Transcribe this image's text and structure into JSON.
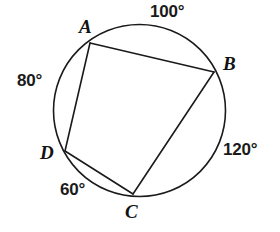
{
  "figure": {
    "type": "circle-inscribed-quadrilateral",
    "background_color": "#ffffff",
    "stroke_color": "#1a1a1a",
    "label_color": "#121212"
  },
  "circle": {
    "name": "circumscribed-circle",
    "center_x": 139.5,
    "center_y": 110.5,
    "radius": 86,
    "stroke_width": 1.6
  },
  "vertices": [
    {
      "id": "A",
      "label": "A",
      "x": 90,
      "y": 43
    },
    {
      "id": "B",
      "label": "B",
      "x": 214,
      "y": 72
    },
    {
      "id": "C",
      "label": "C",
      "x": 133,
      "y": 194
    },
    {
      "id": "D",
      "label": "D",
      "x": 65,
      "y": 151
    }
  ],
  "chords": [
    {
      "id": "AB",
      "from": "A",
      "to": "B",
      "x1": 90,
      "y1": 43,
      "x2": 214,
      "y2": 72
    },
    {
      "id": "BC",
      "from": "B",
      "to": "C",
      "x1": 214,
      "y1": 72,
      "x2": 133,
      "y2": 194
    },
    {
      "id": "CD",
      "from": "C",
      "to": "D",
      "x1": 133,
      "y1": 194,
      "x2": 65,
      "y2": 151
    },
    {
      "id": "DA",
      "from": "D",
      "to": "A",
      "x1": 65,
      "y1": 151,
      "x2": 90,
      "y2": 43
    }
  ],
  "arc_measures": [
    {
      "id": "arc-AB",
      "arc": "AB",
      "value": "100°",
      "position": "top"
    },
    {
      "id": "arc-DA",
      "arc": "DA",
      "value": "80°",
      "position": "left"
    },
    {
      "id": "arc-BC",
      "arc": "BC",
      "value": "120°",
      "position": "right"
    },
    {
      "id": "arc-CD",
      "arc": "CD",
      "value": "60°",
      "position": "bottom-left"
    }
  ]
}
